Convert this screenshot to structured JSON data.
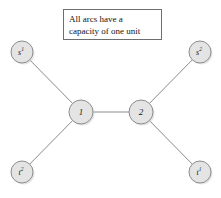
{
  "figure": {
    "background_color": "#ffffff",
    "width": 221,
    "height": 198
  },
  "caption": {
    "line1": "All arcs have a",
    "line2": "capacity of one unit",
    "border_color": "#6e6e6e"
  },
  "graph": {
    "node_fill": "#e4e4e4",
    "node_stroke": "#8c8c8c",
    "edge_color": "#8a8a8a",
    "nodes": [
      {
        "id": "s1",
        "base": "s",
        "sup": "1",
        "cx": 22,
        "cy": 52,
        "r": 11
      },
      {
        "id": "s2",
        "base": "s",
        "sup": "2",
        "cx": 200,
        "cy": 52,
        "r": 11
      },
      {
        "id": "n1",
        "base": "1",
        "sup": "",
        "cx": 81,
        "cy": 112,
        "r": 12
      },
      {
        "id": "n2",
        "base": "2",
        "sup": "",
        "cx": 141,
        "cy": 112,
        "r": 12
      },
      {
        "id": "t2",
        "base": "t",
        "sup": "2",
        "cx": 22,
        "cy": 172,
        "r": 11
      },
      {
        "id": "t1",
        "base": "t",
        "sup": "1",
        "cx": 200,
        "cy": 172,
        "r": 11
      }
    ],
    "edges": [
      {
        "id": "s1-n1",
        "from": "s1",
        "to": "n1"
      },
      {
        "id": "s2-n2",
        "from": "s2",
        "to": "n2"
      },
      {
        "id": "n1-n2",
        "from": "n1",
        "to": "n2"
      },
      {
        "id": "n1-t2",
        "from": "n1",
        "to": "t2"
      },
      {
        "id": "n2-t1",
        "from": "n2",
        "to": "t1"
      }
    ]
  }
}
